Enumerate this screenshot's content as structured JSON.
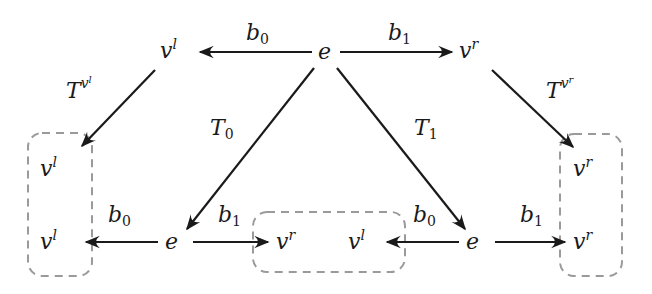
{
  "diagram": {
    "colors": {
      "ink": "#1a1a1a",
      "dashed_box": "#9a9a9a",
      "background": "#ffffff"
    },
    "nodes": {
      "top_vl": {
        "base": "v",
        "sup": "l"
      },
      "top_e": {
        "base": "e"
      },
      "top_vr": {
        "base": "v",
        "sup": "r"
      },
      "left_box_vl_top": {
        "base": "v",
        "sup": "l"
      },
      "left_box_vl_bottom": {
        "base": "v",
        "sup": "l"
      },
      "bottom_left_e": {
        "base": "e"
      },
      "middle_box_vr": {
        "base": "v",
        "sup": "r"
      },
      "middle_box_vl": {
        "base": "v",
        "sup": "l"
      },
      "bottom_right_e": {
        "base": "e"
      },
      "right_box_vr_top": {
        "base": "v",
        "sup": "r"
      },
      "right_box_vr_bottom": {
        "base": "v",
        "sup": "r"
      }
    },
    "edge_labels": {
      "top_b0": {
        "base": "b",
        "sub": "0"
      },
      "top_b1": {
        "base": "b",
        "sub": "1"
      },
      "T_vl": {
        "base": "T",
        "sup_base": "v",
        "sup_sup": "l"
      },
      "T_vr": {
        "base": "T",
        "sup_base": "v",
        "sup_sup": "r"
      },
      "T0": {
        "base": "T",
        "sub": "0"
      },
      "T1": {
        "base": "T",
        "sub": "1"
      },
      "bottom_left_b0": {
        "base": "b",
        "sub": "0"
      },
      "bottom_left_b1": {
        "base": "b",
        "sub": "1"
      },
      "bottom_right_b0": {
        "base": "b",
        "sub": "0"
      },
      "bottom_right_b1": {
        "base": "b",
        "sub": "1"
      }
    }
  }
}
